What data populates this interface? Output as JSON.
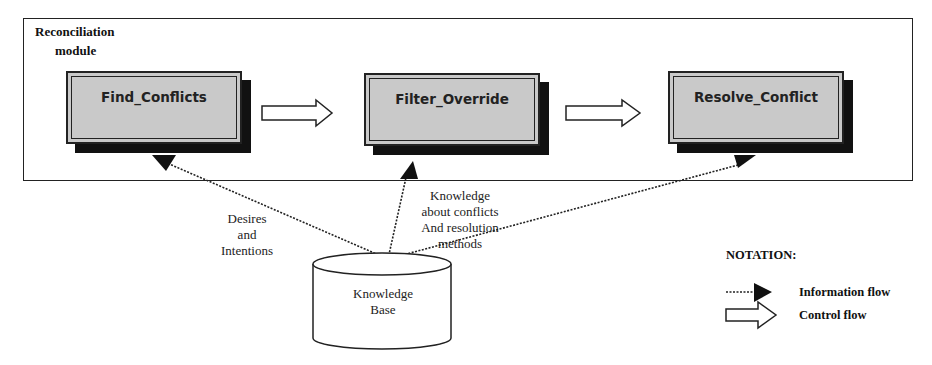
{
  "module": {
    "title_line1": "Reconciliation",
    "title_line2": "module"
  },
  "processes": [
    {
      "label": "Find_Conflicts"
    },
    {
      "label": "Filter_Override"
    },
    {
      "label": "Resolve_Conflict"
    }
  ],
  "information_flow_labels": {
    "desires": [
      "Desires",
      "and",
      "Intentions"
    ],
    "knowledge": [
      "Knowledge",
      "about conflicts",
      "And resolution",
      "methods"
    ]
  },
  "datastore": {
    "label_line1": "Knowledge",
    "label_line2": "Base"
  },
  "legend": {
    "title": "NOTATION:",
    "items": [
      {
        "icon": "dotted-arrow-icon",
        "label": "Information flow"
      },
      {
        "icon": "hollow-arrow-icon",
        "label": "Control flow"
      }
    ]
  },
  "colors": {
    "process_fill": "#c9c9c9",
    "shadow": "#111111",
    "stroke": "#222222",
    "background": "#ffffff"
  }
}
